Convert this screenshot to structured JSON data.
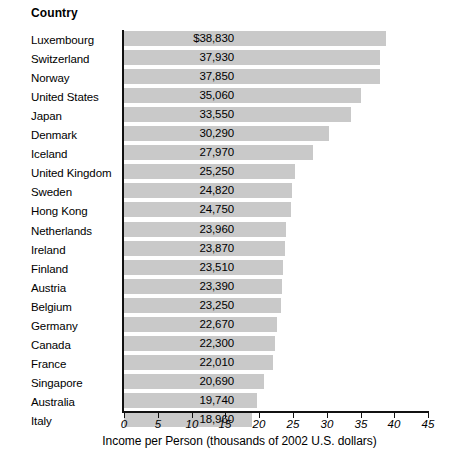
{
  "header": {
    "category_label": "Country"
  },
  "chart_data": {
    "type": "bar",
    "orientation": "horizontal",
    "title": "",
    "subtitle": "",
    "xlabel": "Income per Person (thousands of 2002 U.S. dollars)",
    "ylabel": "Country",
    "xlim": [
      0,
      45
    ],
    "xticks": [
      0,
      5,
      10,
      15,
      20,
      25,
      30,
      35,
      40,
      45
    ],
    "xtick_labels": [
      "0",
      "5",
      "10",
      "15",
      "20",
      "25",
      "30",
      "35",
      "40",
      "45"
    ],
    "grid": false,
    "legend": null,
    "bar_color": "#c9c9c9",
    "axis_color": "#111111",
    "value_units": "thousands of 2002 U.S. dollars",
    "categories": [
      "Luxembourg",
      "Switzerland",
      "Norway",
      "United States",
      "Japan",
      "Denmark",
      "Iceland",
      "United Kingdom",
      "Sweden",
      "Hong Kong",
      "Netherlands",
      "Ireland",
      "Finland",
      "Austria",
      "Belgium",
      "Germany",
      "Canada",
      "France",
      "Singapore",
      "Australia",
      "Italy"
    ],
    "values": [
      38830,
      37930,
      37850,
      35060,
      33550,
      30290,
      27970,
      25250,
      24820,
      24750,
      23960,
      23870,
      23510,
      23390,
      23250,
      22670,
      22300,
      22010,
      20690,
      19740,
      18960
    ],
    "value_labels": [
      "$38,830",
      "37,930",
      "37,850",
      "35,060",
      "33,550",
      "30,290",
      "27,970",
      "25,250",
      "24,820",
      "24,750",
      "23,960",
      "23,870",
      "23,510",
      "23,390",
      "23,250",
      "22,670",
      "22,300",
      "22,010",
      "20,690",
      "19,740",
      "18,960"
    ]
  }
}
